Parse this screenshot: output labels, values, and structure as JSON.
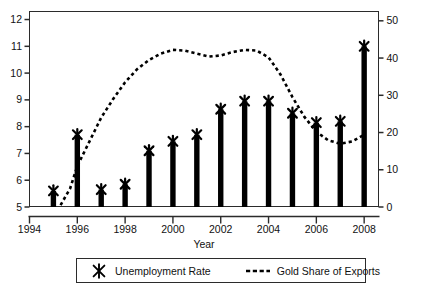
{
  "chart_data": {
    "type": "bar",
    "title": "",
    "xlabel": "Year",
    "ylabel": "",
    "categories": [
      1995,
      1996,
      1997,
      1998,
      1999,
      2000,
      2001,
      2002,
      2003,
      2004,
      2005,
      2006,
      2007,
      2008
    ],
    "xlim": [
      1994,
      2008.6
    ],
    "xticks": [
      1994,
      1996,
      1998,
      2000,
      2002,
      2004,
      2006,
      2008
    ],
    "xticklabels": [
      "1994",
      "1996",
      "1998",
      "2000",
      "2002",
      "2004",
      "2006",
      "2008"
    ],
    "left_axis": {
      "label": "",
      "ylim": [
        5,
        12.3
      ],
      "ticks": [
        5,
        6,
        7,
        8,
        9,
        10,
        11,
        12
      ],
      "ticklabels": [
        "5",
        "6",
        "7",
        "8",
        "9",
        "10",
        "11",
        "12"
      ]
    },
    "right_axis": {
      "label": "",
      "ylim": [
        0,
        52.5
      ],
      "ticks": [
        0,
        10,
        20,
        30,
        40,
        50
      ],
      "ticklabels": [
        "0",
        "10",
        "20",
        "30",
        "40",
        "50"
      ]
    },
    "grid": false,
    "series": [
      {
        "name": "Unemployment Rate",
        "type": "bar",
        "marker": "x-marker",
        "axis": "left",
        "color": "#000000",
        "x": [
          1995,
          1996,
          1997,
          1998,
          1999,
          2000,
          2001,
          2002,
          2003,
          2004,
          2005,
          2006,
          2007,
          2008
        ],
        "values": [
          5.6,
          7.7,
          5.65,
          5.85,
          7.1,
          7.45,
          7.7,
          8.65,
          8.95,
          8.95,
          8.5,
          8.15,
          8.2,
          11.0
        ]
      },
      {
        "name": "Gold Share of Exports",
        "type": "line",
        "linestyle": "dotted",
        "axis": "right",
        "color": "#000000",
        "x": [
          1995.3,
          1995.7,
          1996,
          1996.5,
          1997,
          1997.5,
          1998,
          1998.5,
          1999,
          1999.5,
          2000,
          2000.5,
          2001,
          2001.5,
          2002,
          2002.5,
          2003,
          2003.5,
          2004,
          2004.5,
          2005,
          2005.5,
          2006,
          2006.5,
          2007,
          2007.5,
          2008
        ],
        "values": [
          0.5,
          5,
          11,
          17.5,
          24,
          29,
          33.5,
          37,
          39.5,
          41.2,
          42.2,
          42.0,
          41.2,
          40.4,
          40.7,
          41.6,
          42.2,
          42.0,
          40.2,
          35.6,
          29.5,
          24.2,
          20.2,
          17.9,
          17.0,
          17.6,
          19.4
        ]
      }
    ],
    "legend": {
      "position": "below-axes",
      "entries": [
        {
          "label": "Unemployment Rate",
          "marker": "x-marker"
        },
        {
          "label": "Gold Share of Exports",
          "marker": "dashed-line"
        }
      ]
    }
  }
}
